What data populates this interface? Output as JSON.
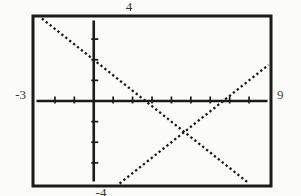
{
  "figure": {
    "top_label": "4",
    "left_label": "-3",
    "right_label": "9",
    "bottom_label": "-4"
  },
  "colors": {
    "ink": "#1b1b1b",
    "label": "#343434",
    "background": "#fbfbfa"
  },
  "chart_data": {
    "type": "line",
    "title": "",
    "xlabel": "",
    "ylabel": "",
    "window": {
      "xmin": -3,
      "xmax": 9,
      "ymin": -4,
      "ymax": 4,
      "xscl": 1,
      "yscl": 1
    },
    "axis_edge_labels": {
      "top": "4",
      "left": "-3",
      "right": "9",
      "bottom": "-4"
    },
    "grid": false,
    "legend": false,
    "line_style": "dotted-pixel",
    "series": [
      {
        "name": "line-decreasing",
        "estimated_equation": "y = -0.75x + 2",
        "slope": -0.75,
        "y_intercept": 2,
        "x_intercept": 2.67,
        "endpoints": [
          [
            -2.67,
            4
          ],
          [
            8,
            -4
          ]
        ]
      },
      {
        "name": "line-increasing",
        "estimated_equation": "y = 0.75x - 5",
        "slope": 0.75,
        "y_intercept": -5,
        "x_intercept": 6.67,
        "endpoints": [
          [
            1.33,
            -4
          ],
          [
            9,
            1.75
          ]
        ]
      }
    ],
    "intersection_estimate": [
      4.67,
      -1.5
    ]
  }
}
